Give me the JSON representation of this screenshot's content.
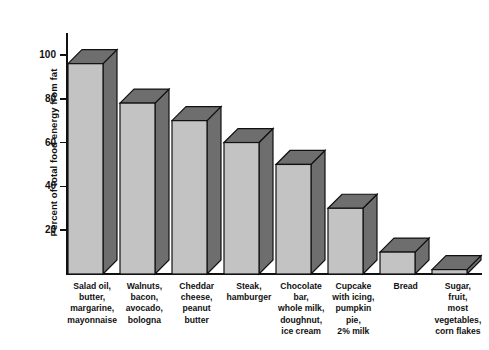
{
  "chart_data": {
    "type": "bar",
    "title": "",
    "xlabel": "",
    "ylabel": "Percent of total food energy from fat",
    "ylim": [
      0,
      110
    ],
    "yticks": [
      20,
      40,
      60,
      80,
      100
    ],
    "ytick_labels": [
      "20",
      "40",
      "60",
      "80",
      "100"
    ],
    "grid": false,
    "legend": null,
    "style": "3d-shaded-bars",
    "categories": [
      "Salad oil,\nbutter,\nmargarine,\nmayonnaise",
      "Walnuts,\nbacon,\navocado,\nbologna",
      "Cheddar\ncheese,\npeanut\nbutter",
      "Steak,\nhamburger",
      "Chocolate\nbar,\nwhole milk,\ndoughnut,\nice cream",
      "Cupcake\nwith icing,\npumpkin\npie,\n2% milk",
      "Bread",
      "Sugar,\nfruit,\nmost\nvegetables,\ncorn flakes"
    ],
    "values": [
      96,
      78,
      70,
      60,
      50,
      30,
      10,
      2
    ],
    "colors": {
      "bar_front": "#c3c3c3",
      "bar_side": "#6e6e6e",
      "bar_outline": "#111111",
      "axis": "#111111",
      "text": "#111111",
      "background": "#ffffff"
    }
  }
}
